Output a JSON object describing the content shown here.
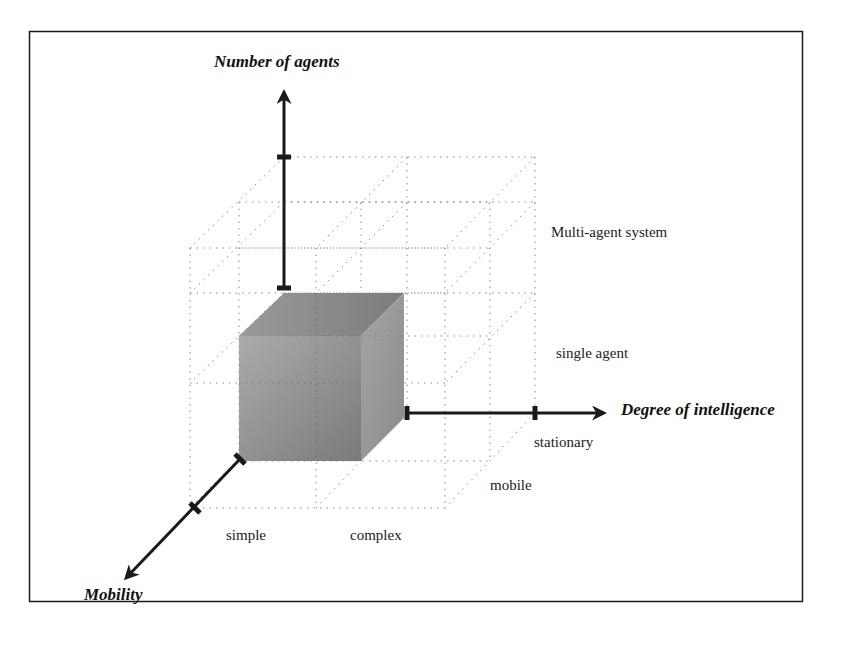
{
  "diagram": {
    "axes": {
      "vertical": {
        "title": "Number of agents"
      },
      "horizontal": {
        "title": "Degree of intelligence"
      },
      "depth": {
        "title": "Mobility"
      }
    },
    "labels": {
      "number_of_agents": [
        "single agent",
        "Multi-agent system"
      ],
      "degree_of_intelligence": [
        "simple",
        "complex"
      ],
      "mobility": [
        "stationary",
        "mobile"
      ]
    },
    "colors": {
      "frame": "#1a1a1a",
      "axis": "#1a1a1a",
      "grid": "#8a8a8a",
      "cube_front_light": "#a8a8a8",
      "cube_front_dark": "#7d7d7d",
      "cube_top": "#8e8e8e",
      "cube_side": "#9a9a9a"
    }
  }
}
